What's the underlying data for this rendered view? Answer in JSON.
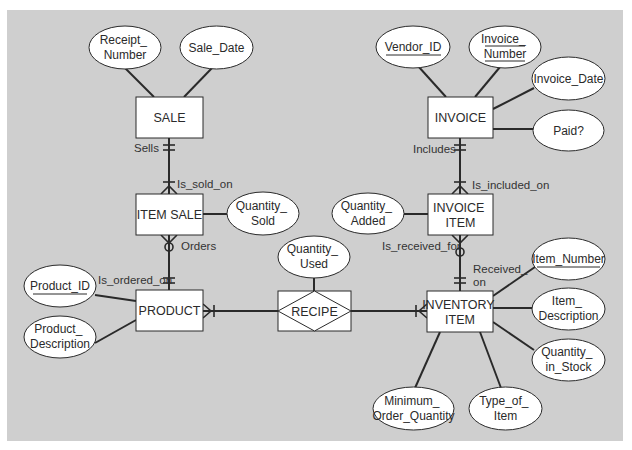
{
  "diagram": {
    "type": "entity-relationship",
    "background": "#cfcfcf",
    "entities": [
      {
        "id": "sale",
        "label": "SALE",
        "x": 136,
        "y": 97,
        "w": 67,
        "h": 41
      },
      {
        "id": "item_sale",
        "label": "ITEM SALE",
        "x": 136,
        "y": 194,
        "w": 67,
        "h": 41
      },
      {
        "id": "product",
        "label": "PRODUCT",
        "x": 136,
        "y": 290,
        "w": 67,
        "h": 41
      },
      {
        "id": "invoice",
        "label": "INVOICE",
        "x": 428,
        "y": 97,
        "w": 65,
        "h": 41
      },
      {
        "id": "invoice_item",
        "label_line1": "INVOICE",
        "label_line2": "ITEM",
        "x": 428,
        "y": 194,
        "w": 65,
        "h": 41
      },
      {
        "id": "inventory_item",
        "label_line1": "INVENTORY",
        "label_line2": "ITEM",
        "x": 427,
        "y": 291,
        "w": 66,
        "h": 41
      }
    ],
    "associative_entity": {
      "id": "recipe",
      "label": "RECIPE",
      "x": 278,
      "y": 291,
      "w": 73,
      "h": 40
    },
    "attributes": {
      "receipt_number": {
        "line1": "Receipt_",
        "line2": "Number",
        "underlined": false
      },
      "sale_date": {
        "line1": "Sale_Date",
        "underlined": false
      },
      "quantity_sold": {
        "line1": "Quantity_",
        "line2": "Sold",
        "underlined": false
      },
      "product_id": {
        "line1": "Product_ID",
        "underlined": true
      },
      "product_description": {
        "line1": "Product_",
        "line2": "Description",
        "underlined": false
      },
      "quantity_used": {
        "line1": "Quantity_",
        "line2": "Used",
        "underlined": false
      },
      "vendor_id": {
        "line1": "Vendor_ID",
        "underlined": true
      },
      "invoice_number": {
        "line1": "Invoice_",
        "line2": "Number",
        "underlined": true
      },
      "invoice_date": {
        "line1": "Invoice_Date",
        "underlined": false
      },
      "paid": {
        "line1": "Paid?",
        "underlined": false
      },
      "quantity_added": {
        "line1": "Quantity_",
        "line2": "Added",
        "underlined": false
      },
      "item_number": {
        "line1": "Item_Number",
        "underlined": true
      },
      "item_description": {
        "line1": "Item_",
        "line2": "Description",
        "underlined": false
      },
      "quantity_in_stock": {
        "line1": "Quantity_",
        "line2": "in_Stock",
        "underlined": false
      },
      "minimum_order_quantity": {
        "line1": "Minimum_",
        "line2": "Order_Quantity",
        "underlined": false
      },
      "type_of_item": {
        "line1": "Type_of_",
        "line2": "Item",
        "underlined": false
      }
    },
    "relationships": {
      "sells": "Sells",
      "is_sold_on": "Is_sold_on",
      "orders": "Orders",
      "is_ordered_on": "Is_ordered_on",
      "includes": "Includes",
      "is_included_on": "Is_included_on",
      "is_received_for": "Is_received_for",
      "received_on_line1": "Received_",
      "received_on_line2": "on"
    }
  }
}
